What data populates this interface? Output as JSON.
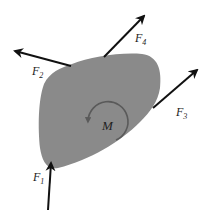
{
  "diagram": {
    "type": "free-body-diagram",
    "body": {
      "fill": "#8a8a8a"
    },
    "moment": {
      "label": "M",
      "direction": "counter-clockwise",
      "color": "#5a5a5a"
    },
    "forces": [
      {
        "id": "F1",
        "label": "F",
        "subscript": "1"
      },
      {
        "id": "F2",
        "label": "F",
        "subscript": "2"
      },
      {
        "id": "F3",
        "label": "F",
        "subscript": "3"
      },
      {
        "id": "F4",
        "label": "F",
        "subscript": "4"
      }
    ],
    "arrow_color": "#111111"
  }
}
